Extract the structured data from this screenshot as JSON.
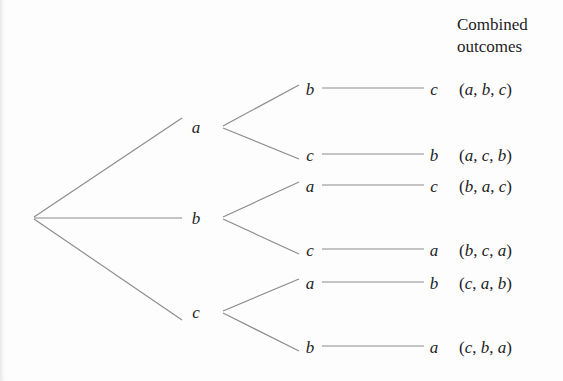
{
  "figure": {
    "type": "tree-diagram",
    "background_color": "#fdfdfd",
    "line_color": "#8c8c8c",
    "text_color": "#1d1d1f"
  },
  "header": {
    "line1": "Combined",
    "line2": "outcomes"
  },
  "tree": {
    "root": {
      "x": 32,
      "y": 218
    },
    "level1": [
      {
        "label": "a",
        "x": 196,
        "y": 127
      },
      {
        "label": "b",
        "x": 196,
        "y": 218
      },
      {
        "label": "c",
        "x": 196,
        "y": 312
      }
    ],
    "level2": [
      {
        "label": "b",
        "x": 310,
        "y": 89,
        "parent": "a"
      },
      {
        "label": "c",
        "x": 310,
        "y": 155,
        "parent": "a"
      },
      {
        "label": "a",
        "x": 310,
        "y": 186,
        "parent": "b"
      },
      {
        "label": "c",
        "x": 310,
        "y": 250,
        "parent": "b"
      },
      {
        "label": "a",
        "x": 310,
        "y": 283,
        "parent": "c"
      },
      {
        "label": "b",
        "x": 310,
        "y": 347,
        "parent": "c"
      }
    ],
    "level3": [
      {
        "label": "c",
        "x": 434,
        "y": 89
      },
      {
        "label": "b",
        "x": 434,
        "y": 155
      },
      {
        "label": "c",
        "x": 434,
        "y": 186
      },
      {
        "label": "a",
        "x": 434,
        "y": 250
      },
      {
        "label": "b",
        "x": 434,
        "y": 283
      },
      {
        "label": "a",
        "x": 434,
        "y": 347
      }
    ]
  },
  "outcomes": [
    {
      "text": "(a, b, c)",
      "x": 459,
      "y": 89,
      "sequence": [
        "a",
        "b",
        "c"
      ]
    },
    {
      "text": "(a, c, b)",
      "x": 459,
      "y": 155,
      "sequence": [
        "a",
        "c",
        "b"
      ]
    },
    {
      "text": "(b, a, c)",
      "x": 459,
      "y": 186,
      "sequence": [
        "b",
        "a",
        "c"
      ]
    },
    {
      "text": "(b, c, a)",
      "x": 459,
      "y": 250,
      "sequence": [
        "b",
        "c",
        "a"
      ]
    },
    {
      "text": "(c, a, b)",
      "x": 459,
      "y": 283,
      "sequence": [
        "c",
        "a",
        "b"
      ]
    },
    {
      "text": "(c, b, a)",
      "x": 459,
      "y": 347,
      "sequence": [
        "c",
        "b",
        "a"
      ]
    }
  ],
  "edges": {
    "root_to_level1": [
      {
        "x1": 34,
        "y1": 217,
        "x2": 182,
        "y2": 118
      },
      {
        "x1": 34,
        "y1": 218,
        "x2": 182,
        "y2": 218
      },
      {
        "x1": 34,
        "y1": 219,
        "x2": 182,
        "y2": 320
      }
    ],
    "level1_to_level2": [
      {
        "x1": 223,
        "y1": 126,
        "x2": 299,
        "y2": 85
      },
      {
        "x1": 223,
        "y1": 128,
        "x2": 299,
        "y2": 159
      },
      {
        "x1": 223,
        "y1": 217,
        "x2": 299,
        "y2": 182
      },
      {
        "x1": 223,
        "y1": 219,
        "x2": 299,
        "y2": 254
      },
      {
        "x1": 223,
        "y1": 311,
        "x2": 299,
        "y2": 279
      },
      {
        "x1": 223,
        "y1": 313,
        "x2": 299,
        "y2": 351
      }
    ],
    "level2_to_level3": [
      {
        "x1": 322,
        "y1": 88,
        "x2": 424,
        "y2": 88
      },
      {
        "x1": 322,
        "y1": 154,
        "x2": 424,
        "y2": 154
      },
      {
        "x1": 322,
        "y1": 185,
        "x2": 424,
        "y2": 185
      },
      {
        "x1": 322,
        "y1": 249,
        "x2": 424,
        "y2": 249
      },
      {
        "x1": 322,
        "y1": 282,
        "x2": 424,
        "y2": 282
      },
      {
        "x1": 322,
        "y1": 346,
        "x2": 424,
        "y2": 346
      }
    ]
  }
}
